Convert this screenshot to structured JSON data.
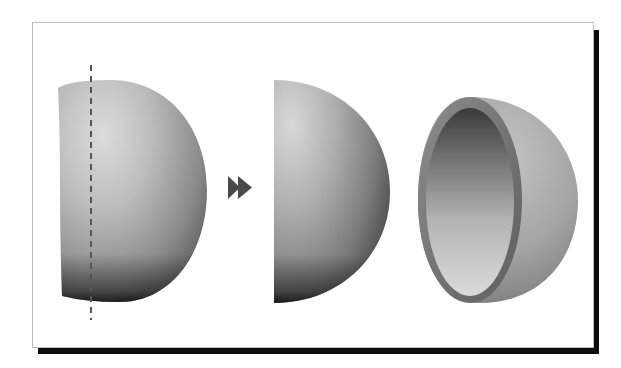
{
  "figure": {
    "steps": [
      {
        "name": "sphere-with-cut-line",
        "shape": "truncated sphere",
        "cut_line": "dashed vertical"
      },
      {
        "name": "solid-hemisphere",
        "shape": "half sphere"
      },
      {
        "name": "hollow-hemisphere-shell",
        "shape": "hemispherical shell"
      }
    ],
    "arrow": {
      "glyph": "double-chevron-right",
      "meaning": "transforms into"
    }
  },
  "colors": {
    "frame_border": "#bdbdbd",
    "frame_shadow": "#0d0d0d",
    "background": "#ffffff",
    "sphere_light": "#d9d9d9",
    "sphere_mid": "#9a9a9a",
    "sphere_dark": "#2a2a2a",
    "arrow": "#4a4a4a",
    "dash_line": "#555555"
  }
}
